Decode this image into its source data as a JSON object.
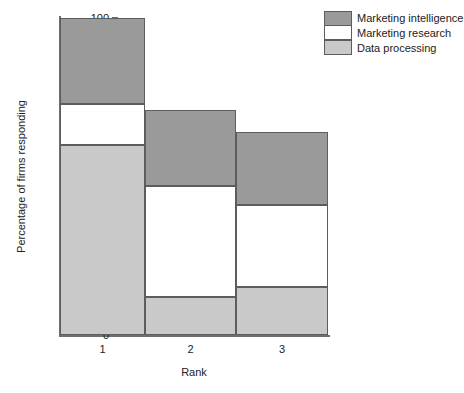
{
  "chart_data": {
    "type": "bar",
    "subtype": "stacked-bar",
    "title": "",
    "xlabel": "Rank",
    "ylabel": "Percentage of firms responding",
    "categories": [
      "1",
      "2",
      "3"
    ],
    "ylim": [
      0,
      100
    ],
    "yticks": [
      0,
      20,
      40,
      60,
      80,
      100
    ],
    "ytick_labels": [
      "0",
      "20",
      "40",
      "60",
      "80",
      "100"
    ],
    "grid": false,
    "legend_position": "top-right",
    "series": [
      {
        "name": "Marketing intelligence",
        "color": "#9a9a9a",
        "values": [
          27,
          24,
          23
        ],
        "cumulative_tops": [
          100,
          71,
          64
        ]
      },
      {
        "name": "Marketing research",
        "color": "#ffffff",
        "values": [
          13,
          35,
          26
        ],
        "cumulative_tops": [
          73,
          47,
          41
        ]
      },
      {
        "name": "Data processing",
        "color": "#c9c9c9",
        "values": [
          60,
          12,
          15
        ],
        "cumulative_tops": [
          60,
          12,
          15
        ]
      }
    ],
    "bar_totals": [
      100,
      71,
      64
    ]
  },
  "legend": {
    "items": [
      {
        "label": "Marketing intelligence",
        "color": "#9a9a9a"
      },
      {
        "label": "Marketing research",
        "color": "#ffffff"
      },
      {
        "label": "Data processing",
        "color": "#c9c9c9"
      }
    ]
  },
  "axes": {
    "y_title": "Percentage of firms responding",
    "x_title": "Rank",
    "y_tick_labels": [
      "100",
      "80",
      "60",
      "40",
      "20",
      "0"
    ],
    "x_tick_labels": [
      "1",
      "2",
      "3"
    ]
  },
  "colors": {
    "axis": "#6e6e6e",
    "bar_outline": "#5d5d5d",
    "marketing_intelligence": "#9a9a9a",
    "marketing_research": "#ffffff",
    "data_processing": "#c9c9c9",
    "background": "#ffffff",
    "text": "#222222"
  }
}
